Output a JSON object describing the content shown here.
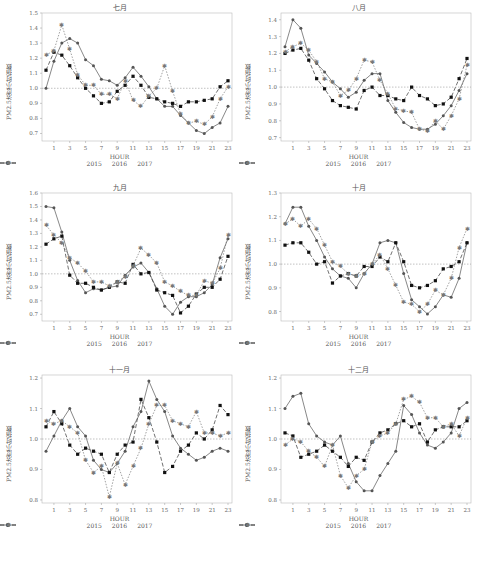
{
  "figure": {
    "y_axis_label": "PM2.5浓度小时指数",
    "x_axis_label": "HOUR",
    "legend": [
      "2015",
      "2016",
      "2017"
    ],
    "x_ticks": [
      1,
      3,
      5,
      7,
      9,
      11,
      13,
      15,
      17,
      19,
      21,
      23
    ],
    "reference_line": 1.0
  },
  "chart_data": [
    {
      "type": "line",
      "title": "七月",
      "xlabel": "HOUR",
      "ylabel": "PM2.5浓度小时指数",
      "ylim": [
        0.65,
        1.5
      ],
      "yticks": [
        0.7,
        0.8,
        0.9,
        1.0,
        1.1,
        1.2,
        1.3,
        1.4,
        1.5
      ],
      "x": [
        0,
        1,
        2,
        3,
        4,
        5,
        6,
        7,
        8,
        9,
        10,
        11,
        12,
        13,
        14,
        15,
        16,
        17,
        18,
        19,
        20,
        21,
        22,
        23
      ],
      "series": [
        {
          "name": "2015",
          "values": [
            1.0,
            1.18,
            1.3,
            1.33,
            1.3,
            1.19,
            1.15,
            1.06,
            1.05,
            1.02,
            1.07,
            1.14,
            1.08,
            1.01,
            0.93,
            0.88,
            0.88,
            0.82,
            0.77,
            0.72,
            0.7,
            0.74,
            0.77,
            0.88
          ]
        },
        {
          "name": "2016",
          "values": [
            1.12,
            1.24,
            1.22,
            1.15,
            1.07,
            1.0,
            0.95,
            0.9,
            0.91,
            0.98,
            1.02,
            1.08,
            1.02,
            0.94,
            0.93,
            0.91,
            0.9,
            0.88,
            0.91,
            0.91,
            0.92,
            0.93,
            1.01,
            1.05
          ]
        },
        {
          "name": "2017",
          "values": [
            1.22,
            1.25,
            1.42,
            1.26,
            1.09,
            1.02,
            1.02,
            0.96,
            0.96,
            0.93,
            1.05,
            0.92,
            0.88,
            0.95,
            1.0,
            1.15,
            0.98,
            0.83,
            0.77,
            0.78,
            0.76,
            0.81,
            0.93,
            1.01
          ]
        }
      ]
    },
    {
      "type": "line",
      "title": "八月",
      "xlabel": "HOUR",
      "ylabel": "PM2.5浓度小时指数",
      "ylim": [
        0.68,
        1.44
      ],
      "yticks": [
        0.7,
        0.8,
        0.9,
        1.0,
        1.1,
        1.2,
        1.3,
        1.4
      ],
      "x": [
        0,
        1,
        2,
        3,
        4,
        5,
        6,
        7,
        8,
        9,
        10,
        11,
        12,
        13,
        14,
        15,
        16,
        17,
        18,
        19,
        20,
        21,
        22,
        23
      ],
      "series": [
        {
          "name": "2015",
          "values": [
            1.24,
            1.4,
            1.35,
            1.19,
            1.14,
            1.09,
            1.03,
            0.99,
            0.94,
            0.97,
            1.04,
            1.08,
            1.08,
            0.92,
            0.85,
            0.79,
            0.76,
            0.75,
            0.75,
            0.78,
            0.83,
            0.89,
            0.98,
            1.08
          ]
        },
        {
          "name": "2016",
          "values": [
            1.2,
            1.22,
            1.23,
            1.16,
            1.05,
            0.99,
            0.92,
            0.89,
            0.88,
            0.87,
            0.98,
            1.0,
            0.95,
            0.95,
            0.93,
            0.92,
            1.0,
            0.95,
            0.93,
            0.89,
            0.9,
            0.94,
            1.05,
            1.17
          ]
        },
        {
          "name": "2017",
          "values": [
            1.21,
            1.24,
            1.26,
            1.22,
            1.15,
            1.05,
            1.03,
            0.95,
            0.98,
            1.05,
            1.16,
            1.15,
            1.04,
            0.96,
            0.87,
            0.86,
            0.85,
            0.75,
            0.74,
            0.8,
            0.75,
            0.83,
            0.93,
            1.13
          ]
        }
      ]
    },
    {
      "type": "line",
      "title": "九月",
      "xlabel": "HOUR",
      "ylabel": "PM2.5浓度小时指数",
      "ylim": [
        0.65,
        1.6
      ],
      "yticks": [
        0.7,
        0.8,
        0.9,
        1.0,
        1.1,
        1.2,
        1.3,
        1.4,
        1.5,
        1.6
      ],
      "x": [
        0,
        1,
        2,
        3,
        4,
        5,
        6,
        7,
        8,
        9,
        10,
        11,
        12,
        13,
        14,
        15,
        16,
        17,
        18,
        19,
        20,
        21,
        22,
        23
      ],
      "series": [
        {
          "name": "2015",
          "values": [
            1.5,
            1.49,
            1.31,
            1.1,
            0.95,
            0.86,
            0.89,
            0.88,
            0.9,
            0.91,
            0.99,
            1.05,
            1.08,
            1.01,
            0.89,
            0.76,
            0.7,
            0.79,
            0.83,
            0.83,
            0.86,
            0.92,
            1.12,
            1.26
          ]
        },
        {
          "name": "2016",
          "values": [
            1.22,
            1.26,
            1.28,
            0.99,
            0.93,
            0.93,
            0.9,
            0.88,
            0.9,
            0.94,
            0.93,
            1.07,
            1.0,
            1.01,
            0.88,
            0.86,
            0.84,
            0.71,
            0.76,
            0.85,
            0.9,
            0.9,
            0.96,
            1.13
          ]
        },
        {
          "name": "2017",
          "values": [
            1.36,
            1.29,
            1.23,
            1.12,
            1.08,
            1.02,
            0.94,
            0.94,
            0.91,
            0.94,
            0.98,
            1.06,
            1.19,
            1.14,
            1.08,
            0.94,
            0.91,
            0.87,
            0.84,
            0.84,
            0.95,
            0.93,
            1.04,
            1.29
          ]
        }
      ]
    },
    {
      "type": "line",
      "title": "十月",
      "xlabel": "HOUR",
      "ylabel": "PM2.5浓度小时指数",
      "ylim": [
        0.76,
        1.3
      ],
      "yticks": [
        0.8,
        0.9,
        1.0,
        1.1,
        1.2,
        1.3
      ],
      "x": [
        0,
        1,
        2,
        3,
        4,
        5,
        6,
        7,
        8,
        9,
        10,
        11,
        12,
        13,
        14,
        15,
        16,
        17,
        18,
        19,
        20,
        21,
        22,
        23
      ],
      "series": [
        {
          "name": "2015",
          "values": [
            1.17,
            1.24,
            1.24,
            1.16,
            1.1,
            1.03,
            0.98,
            0.95,
            0.94,
            0.9,
            0.96,
            1.0,
            1.09,
            1.1,
            1.09,
            0.96,
            0.85,
            0.82,
            0.79,
            0.82,
            0.87,
            0.86,
            0.94,
            1.09
          ]
        },
        {
          "name": "2016",
          "values": [
            1.08,
            1.09,
            1.09,
            1.05,
            1.0,
            1.01,
            0.92,
            0.95,
            0.96,
            0.95,
            0.99,
            0.99,
            1.03,
            1.01,
            1.09,
            1.01,
            0.91,
            0.9,
            0.91,
            0.93,
            0.98,
            0.99,
            1.01,
            1.09
          ]
        },
        {
          "name": "2017",
          "values": [
            1.17,
            1.19,
            1.16,
            1.19,
            1.15,
            1.08,
            1.01,
            0.99,
            0.96,
            0.95,
            0.96,
            1.0,
            1.04,
            0.98,
            0.91,
            0.84,
            0.83,
            0.8,
            0.83,
            0.89,
            0.87,
            0.94,
            1.07,
            1.15
          ]
        }
      ]
    },
    {
      "type": "line",
      "title": "十一月",
      "xlabel": "HOUR",
      "ylabel": "PM2.5浓度小时指数",
      "ylim": [
        0.79,
        1.21
      ],
      "yticks": [
        0.8,
        0.9,
        1.0,
        1.1,
        1.2
      ],
      "x": [
        0,
        1,
        2,
        3,
        4,
        5,
        6,
        7,
        8,
        9,
        10,
        11,
        12,
        13,
        14,
        15,
        16,
        17,
        18,
        19,
        20,
        21,
        22,
        23
      ],
      "series": [
        {
          "name": "2015",
          "values": [
            0.96,
            1.01,
            1.06,
            1.1,
            1.04,
            1.01,
            0.93,
            0.9,
            0.89,
            0.92,
            0.96,
            1.04,
            1.09,
            1.19,
            1.13,
            1.09,
            1.01,
            0.97,
            0.95,
            0.93,
            0.94,
            0.96,
            0.97,
            0.96
          ]
        },
        {
          "name": "2016",
          "values": [
            1.04,
            1.09,
            1.05,
            0.98,
            0.95,
            0.97,
            0.96,
            0.95,
            0.89,
            0.95,
            0.98,
            0.99,
            1.13,
            1.07,
            0.99,
            0.89,
            0.91,
            0.96,
            0.98,
            1.02,
            1.0,
            1.03,
            1.11,
            1.08
          ]
        },
        {
          "name": "2017",
          "values": [
            1.06,
            1.05,
            1.06,
            1.04,
            1.02,
            0.93,
            0.89,
            0.91,
            0.81,
            0.92,
            0.85,
            0.91,
            0.97,
            1.05,
            1.11,
            1.11,
            1.06,
            1.05,
            1.04,
            1.09,
            1.02,
            1.02,
            1.01,
            1.02
          ]
        }
      ]
    },
    {
      "type": "line",
      "title": "十二月",
      "xlabel": "HOUR",
      "ylabel": "PM2.5浓度小时指数",
      "ylim": [
        0.79,
        1.21
      ],
      "yticks": [
        0.8,
        0.9,
        1.0,
        1.1,
        1.2
      ],
      "x": [
        0,
        1,
        2,
        3,
        4,
        5,
        6,
        7,
        8,
        9,
        10,
        11,
        12,
        13,
        14,
        15,
        16,
        17,
        18,
        19,
        20,
        21,
        22,
        23
      ],
      "series": [
        {
          "name": "2015",
          "values": [
            1.1,
            1.14,
            1.15,
            1.05,
            1.01,
            0.99,
            0.98,
            1.01,
            0.92,
            0.86,
            0.83,
            0.83,
            0.88,
            0.92,
            0.96,
            1.11,
            1.08,
            1.02,
            0.98,
            0.97,
            0.99,
            1.02,
            1.1,
            1.12
          ]
        },
        {
          "name": "2016",
          "values": [
            1.02,
            1.01,
            0.94,
            0.95,
            0.96,
            0.98,
            0.96,
            0.94,
            0.91,
            0.94,
            0.93,
            0.99,
            1.02,
            1.03,
            1.05,
            1.06,
            1.04,
            1.05,
            0.99,
            1.03,
            1.04,
            1.04,
            1.04,
            1.06
          ]
        },
        {
          "name": "2017",
          "values": [
            0.98,
            1.0,
            0.99,
            0.96,
            0.94,
            0.91,
            0.98,
            0.88,
            0.84,
            0.88,
            0.9,
            0.99,
            1.01,
            1.02,
            1.05,
            1.13,
            1.14,
            1.12,
            1.07,
            1.07,
            1.04,
            1.05,
            1.01,
            1.07
          ]
        }
      ]
    }
  ]
}
